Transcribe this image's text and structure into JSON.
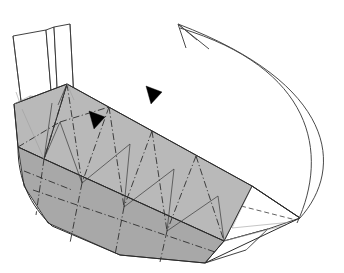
{
  "figure": {
    "title": "Origami folding step diagram",
    "background_color": "#ffffff",
    "canvas": {
      "width": 344,
      "height": 273
    }
  },
  "colors": {
    "paper_shaded": "#b9b9b9",
    "paper_shaded_dark": "#a8a8a8",
    "paper_white": "#ffffff",
    "line_primary": "#2b2b2b",
    "line_secondary": "#4a4a4a",
    "line_faint": "#9d9d9d",
    "marker_fill": "#000000"
  },
  "geometry": {
    "main_body": {
      "name": "folded-paper-body",
      "top_edge": "M 67,84 L 252,186",
      "outline": "M 14,104 L 67,84 L 252,186 L 300,218 L 262,225 L 120,255 L 40,205 L 14,104 Z"
    },
    "body_panels": [
      {
        "id": "upper-left-face",
        "points": "67,84 109,107 82,183 44,159"
      },
      {
        "id": "upper-mid-face",
        "points": "109,107 152,131 124,207 82,183"
      },
      {
        "id": "upper-right-face",
        "points": "152,131 196,156 167,231 124,207"
      },
      {
        "id": "upper-far-face",
        "points": "196,156 252,186 224,241 167,231"
      },
      {
        "id": "left-end-face",
        "points": "14,104 67,84 44,159 18,147"
      },
      {
        "id": "lower-hull-left",
        "points": "18,147 44,159 82,183 60,232 30,196"
      },
      {
        "id": "lower-hull-mid",
        "points": "82,183 124,207 104,251 60,232"
      },
      {
        "id": "lower-hull-right",
        "points": "124,207 167,231 150,262 104,251"
      },
      {
        "id": "lower-hull-far",
        "points": "167,231 224,241 205,263 150,262"
      }
    ],
    "upright_flaps": [
      {
        "id": "flap-left",
        "points": "13,36 46,30 52,103 22,109"
      },
      {
        "id": "flap-right",
        "points": "54,27 70,24 74,100 58,105"
      },
      {
        "id": "flap-inner",
        "points": "46,30 54,27 58,105 52,103"
      }
    ],
    "tail_point": {
      "id": "tapered-right-tip",
      "white_faces": [
        "224,241 252,186 300,218 262,225",
        "252,186 300,218 288,226 246,196",
        "224,241 262,225 246,248 205,263"
      ],
      "gray_faces": [
        "205,263 246,248 262,225 300,218 282,234",
        "224,241 205,263 196,240"
      ]
    },
    "creases_dashdot": [
      "M 67,84 L 60,232",
      "M 109,107 L 104,251",
      "M 152,131 L 150,262",
      "M 196,156 L 205,263",
      "M 44,159 L 224,241",
      "M 82,183 L 252,186",
      "M 18,147 L 30,196",
      "M 67,84 L 44,159",
      "M 109,107 L 82,183",
      "M 152,131 L 124,207",
      "M 196,156 L 167,231"
    ],
    "creases_dashed": [
      "M 252,186 L 300,218",
      "M 246,196 L 288,226",
      "M 224,241 L 262,225",
      "M 58,105 L 82,183",
      "M 52,103 L 44,159"
    ],
    "motion_arrow": {
      "id": "curved-motion-arrow",
      "path": "M 300,218 C 344,170 334,86 178,24",
      "path_inner": "M 298,222 C 330,150 310,70 180,28",
      "arrowhead_lines": [
        "M 178,24 L 196,39",
        "M 178,24 L 186,47",
        "M 178,24 L 207,48"
      ],
      "direction": "from right tip sweeping up and to the upper left"
    },
    "solid_markers": [
      {
        "id": "fold-marker-1",
        "points": "148,88 161,92 152,103",
        "label": "solid triangular fold indicator"
      },
      {
        "id": "fold-marker-2",
        "points": "91,113 104,117 95,128",
        "label": "solid triangular fold indicator"
      }
    ]
  }
}
